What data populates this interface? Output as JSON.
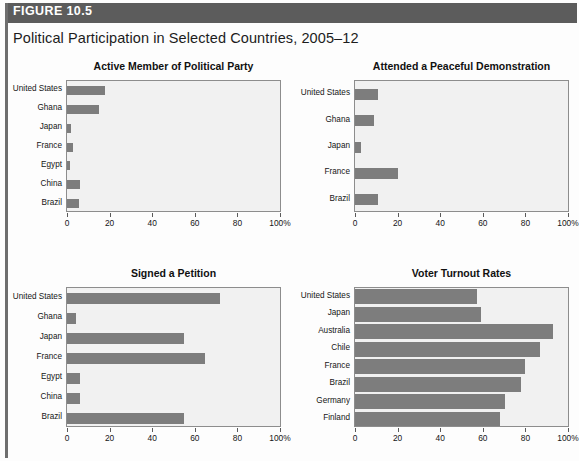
{
  "figure": {
    "label": "FIGURE 10.5",
    "title": "Political Participation in Selected Countries, 2005–12",
    "header_color": "#5c5c5c",
    "bar_color": "#7d7d7d",
    "plot_background": "#f1f1f1"
  },
  "chart_data": [
    {
      "type": "bar",
      "orientation": "horizontal",
      "title": "Active Member of Political Party",
      "xlabel": "",
      "ylabel": "",
      "xlim": [
        0,
        100
      ],
      "xticks": [
        0,
        20,
        40,
        60,
        80,
        100
      ],
      "xticklabels": [
        "0",
        "20",
        "40",
        "60",
        "80",
        "100%"
      ],
      "grid": false,
      "legend": "none",
      "categories": [
        "United States",
        "Ghana",
        "Japan",
        "France",
        "Egypt",
        "China",
        "Brazil"
      ],
      "values": [
        18,
        15,
        2,
        3,
        1.5,
        6,
        5.5
      ]
    },
    {
      "type": "bar",
      "orientation": "horizontal",
      "title": "Attended a Peaceful Demonstration",
      "xlabel": "",
      "ylabel": "",
      "xlim": [
        0,
        100
      ],
      "xticks": [
        0,
        20,
        40,
        60,
        80,
        100
      ],
      "xticklabels": [
        "0",
        "20",
        "40",
        "60",
        "80",
        "100%"
      ],
      "grid": false,
      "legend": "none",
      "categories": [
        "United States",
        "Ghana",
        "Japan",
        "France",
        "Brazil"
      ],
      "values": [
        11,
        9,
        3,
        20,
        11
      ]
    },
    {
      "type": "bar",
      "orientation": "horizontal",
      "title": "Signed a Petition",
      "xlabel": "",
      "ylabel": "",
      "xlim": [
        0,
        100
      ],
      "xticks": [
        0,
        20,
        40,
        60,
        80,
        100
      ],
      "xticklabels": [
        "0",
        "20",
        "40",
        "60",
        "80",
        "100%"
      ],
      "grid": false,
      "legend": "none",
      "categories": [
        "United States",
        "Ghana",
        "Japan",
        "France",
        "Egypt",
        "China",
        "Brazil"
      ],
      "values": [
        72,
        4,
        55,
        65,
        6,
        6,
        55
      ]
    },
    {
      "type": "bar",
      "orientation": "horizontal",
      "title": "Voter Turnout Rates",
      "xlabel": "",
      "ylabel": "",
      "xlim": [
        0,
        100
      ],
      "xticks": [
        0,
        20,
        40,
        60,
        80,
        100
      ],
      "xticklabels": [
        "0",
        "20",
        "40",
        "60",
        "80",
        "100%"
      ],
      "grid": false,
      "legend": "none",
      "categories": [
        "United States",
        "Japan",
        "Australia",
        "Chile",
        "France",
        "Brazil",
        "Germany",
        "Finland"
      ],
      "values": [
        57.5,
        59,
        93,
        87,
        80,
        78,
        70.5,
        68
      ]
    }
  ]
}
